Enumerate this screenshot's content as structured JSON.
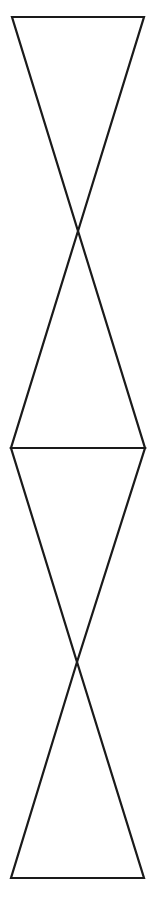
{
  "figure": {
    "stroke_color": "#1a1a1a",
    "background": "#ffffff",
    "stroke_width": 2.2,
    "shapes": [
      {
        "name": "top-inverted-triangle",
        "points": [
          [
            12,
            17
          ],
          [
            144,
            17
          ],
          [
            78,
            231
          ]
        ]
      },
      {
        "name": "upper-middle-triangle",
        "points": [
          [
            78,
            231
          ],
          [
            11,
            448
          ],
          [
            145,
            448
          ]
        ]
      },
      {
        "name": "lower-middle-inverted-triangle",
        "points": [
          [
            11,
            448
          ],
          [
            145,
            448
          ],
          [
            77,
            662
          ]
        ]
      },
      {
        "name": "bottom-triangle",
        "points": [
          [
            77,
            662
          ],
          [
            11,
            878
          ],
          [
            144,
            878
          ]
        ]
      }
    ]
  }
}
